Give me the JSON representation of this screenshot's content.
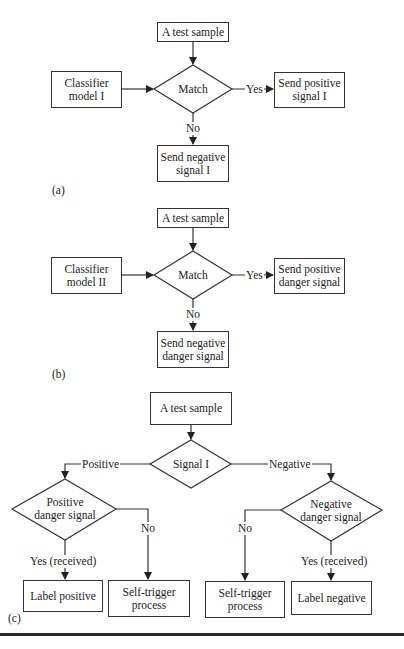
{
  "panel_a": {
    "caption": "(a)",
    "start": "A test sample",
    "input": "Classifier\nmodel I",
    "decision": "Match",
    "yes_label": "Yes",
    "no_label": "No",
    "yes_out": "Send positive\nsignal I",
    "no_out": "Send negative\nsignal I"
  },
  "panel_b": {
    "caption": "(b)",
    "start": "A test sample",
    "input": "Classifier\nmodel II",
    "decision": "Match",
    "yes_label": "Yes",
    "no_label": "No",
    "yes_out": "Send positive\ndanger signal",
    "no_out": "Send negative\ndanger signal"
  },
  "panel_c": {
    "caption": "(c)",
    "start": "A test sample",
    "decision": "Signal I",
    "positive_label": "Positive",
    "negative_label": "Negative",
    "left_decision": "Positive\ndanger signal",
    "right_decision": "Negative\ndanger signal",
    "left_yes_label": "Yes (received)",
    "left_no_label": "No",
    "right_no_label": "No",
    "right_yes_label": "Yes (received)",
    "left_yes_out": "Label positive",
    "left_no_out": "Self-trigger\nprocess",
    "right_no_out": "Self-trigger\nprocess",
    "right_yes_out": "Label negative"
  },
  "colors": {
    "stroke": "#333333",
    "background": "#ffffff"
  }
}
